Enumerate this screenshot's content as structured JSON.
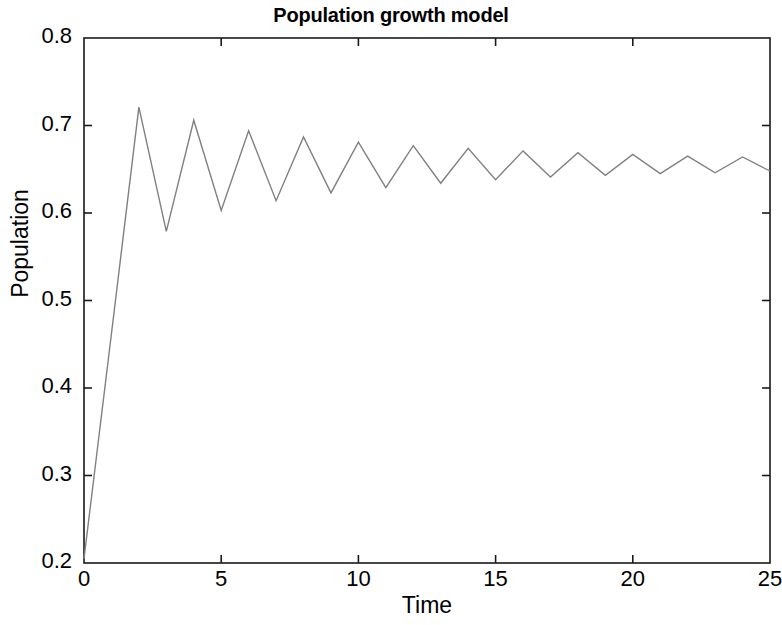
{
  "chart_data": {
    "type": "line",
    "title": "Population growth model",
    "xlabel": "Time",
    "ylabel": "Population",
    "xlim": [
      0,
      25
    ],
    "ylim": [
      0.2,
      0.8
    ],
    "xticks": [
      0,
      5,
      10,
      15,
      20,
      25
    ],
    "yticks": [
      0.2,
      0.3,
      0.4,
      0.5,
      0.6,
      0.7,
      0.8
    ],
    "xtick_labels": [
      "0",
      "5",
      "10",
      "15",
      "20",
      "25"
    ],
    "ytick_labels": [
      "0.2",
      "0.3",
      "0.4",
      "0.5",
      "0.6",
      "0.7",
      "0.8"
    ],
    "grid": false,
    "legend": null,
    "line_color": "#808080",
    "line_width": 1.4,
    "box": true,
    "tick_direction": "in",
    "x": [
      0,
      1,
      2,
      3,
      4,
      5,
      6,
      7,
      8,
      9,
      10,
      11,
      12,
      13,
      14,
      15,
      16,
      17,
      18,
      19,
      20,
      21,
      22,
      23,
      24,
      25
    ],
    "y": [
      0.205,
      0.462,
      0.721,
      0.579,
      0.706,
      0.603,
      0.694,
      0.614,
      0.687,
      0.623,
      0.681,
      0.629,
      0.677,
      0.634,
      0.674,
      0.638,
      0.671,
      0.641,
      0.669,
      0.643,
      0.667,
      0.645,
      0.665,
      0.646,
      0.664,
      0.648
    ],
    "series": [
      {
        "name": "Population",
        "values": [
          0.205,
          0.462,
          0.721,
          0.579,
          0.706,
          0.603,
          0.694,
          0.614,
          0.687,
          0.623,
          0.681,
          0.629,
          0.677,
          0.634,
          0.674,
          0.638,
          0.671,
          0.641,
          0.669,
          0.643,
          0.667,
          0.645,
          0.665,
          0.646,
          0.664,
          0.648
        ]
      }
    ]
  },
  "figure": {
    "background": "#ffffff",
    "axis_color": "#1a1a1a"
  }
}
